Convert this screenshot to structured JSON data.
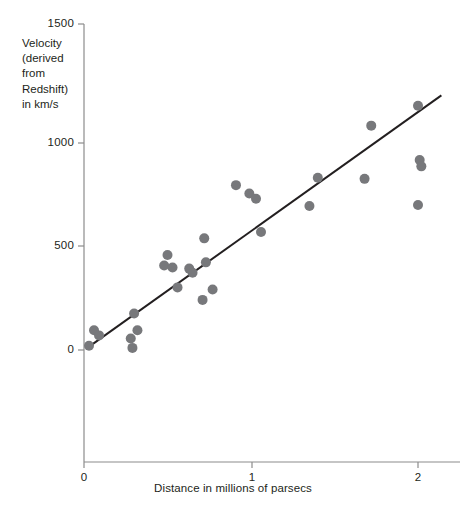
{
  "chart_data": {
    "type": "scatter",
    "title": "",
    "xlabel": "Distance in millions of parsecs",
    "ylabel": "Velocity (derived from Redshift) in km/s",
    "ylabel_lines": [
      "Velocity",
      "(derived",
      "from",
      "Redshift)",
      "in km/s"
    ],
    "xlim": [
      0,
      2.3
    ],
    "ylim": [
      -600,
      1500
    ],
    "xticks": [
      0,
      1,
      2
    ],
    "xtick_labels": [
      "0",
      "1",
      "2"
    ],
    "yticks": [
      0,
      500,
      1000,
      1500
    ],
    "ytick_labels": [
      "0",
      "500",
      "1000",
      "1500"
    ],
    "grid": false,
    "legend": null,
    "marker_color": "#77787b",
    "line_color": "#231f20",
    "axis_color": "#8c8c8c",
    "series": [
      {
        "name": "Galaxies",
        "type": "scatter",
        "points": [
          [
            0.03,
            20
          ],
          [
            0.06,
            95
          ],
          [
            0.09,
            70
          ],
          [
            0.3,
            175
          ],
          [
            0.28,
            55
          ],
          [
            0.29,
            10
          ],
          [
            0.32,
            95
          ],
          [
            0.5,
            455
          ],
          [
            0.48,
            405
          ],
          [
            0.53,
            395
          ],
          [
            0.56,
            300
          ],
          [
            0.63,
            390
          ],
          [
            0.65,
            370
          ],
          [
            0.72,
            535
          ],
          [
            0.73,
            420
          ],
          [
            0.71,
            240
          ],
          [
            0.77,
            290
          ],
          [
            0.91,
            790
          ],
          [
            0.99,
            750
          ],
          [
            1.03,
            725
          ],
          [
            1.06,
            565
          ],
          [
            1.35,
            690
          ],
          [
            1.4,
            825
          ],
          [
            1.72,
            1075
          ],
          [
            1.68,
            820
          ],
          [
            2.0,
            1170
          ],
          [
            2.01,
            910
          ],
          [
            2.02,
            880
          ],
          [
            2.0,
            695
          ]
        ]
      },
      {
        "name": "Best fit line",
        "type": "line",
        "x_start": 0.02,
        "y_start": 10,
        "x_end": 2.14,
        "y_end": 1220
      }
    ]
  },
  "axes": {
    "x_pixel_zero": 84,
    "x_pixel_per_unit": 167,
    "y_pixel_zero": 350,
    "y_pixel_per_unit": 0.2087
  }
}
